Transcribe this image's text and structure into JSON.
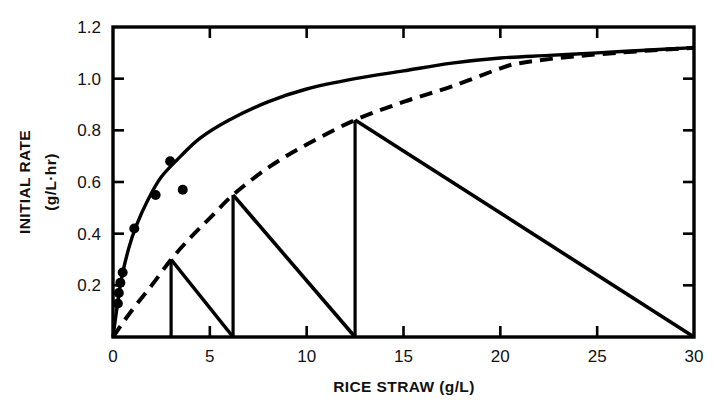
{
  "figure": {
    "background_color": "#ffffff",
    "ink_color": "#000000"
  },
  "chart_data": {
    "type": "line",
    "title": "",
    "xlabel": "RICE STRAW (g/L)",
    "ylabel": "INITIAL RATE (g/L·hr)",
    "xlim": [
      0,
      30
    ],
    "ylim": [
      0,
      1.2
    ],
    "grid": false,
    "legend": null,
    "x_ticks": [
      0,
      5,
      10,
      15,
      20,
      25,
      30
    ],
    "x_tick_labels": [
      "0",
      "5",
      "10",
      "15",
      "20",
      "25",
      "30"
    ],
    "y_ticks": [
      0,
      0.2,
      0.4,
      0.6,
      0.8,
      1.0,
      1.2
    ],
    "y_tick_labels": [
      "0",
      "0.2",
      "0.4",
      "0.6",
      "0.8",
      "1.0",
      "1.2"
    ],
    "series": [
      {
        "name": "upper-saturation-curve",
        "style": "solid",
        "x": [
          0,
          0.4,
          0.8,
          1.2,
          1.8,
          2.5,
          3.5,
          4.5,
          6,
          8,
          10,
          12.5,
          15,
          17.5,
          20,
          22.5,
          25,
          27.5,
          30
        ],
        "values": [
          0.0,
          0.21,
          0.34,
          0.43,
          0.53,
          0.62,
          0.7,
          0.77,
          0.84,
          0.91,
          0.96,
          1.0,
          1.03,
          1.06,
          1.08,
          1.09,
          1.1,
          1.11,
          1.12
        ]
      },
      {
        "name": "lower-dashed-curve",
        "style": "dashed",
        "x": [
          0,
          0.6,
          1.2,
          2,
          3,
          4,
          5,
          6.2,
          8,
          10,
          12.5,
          15,
          17.5,
          20,
          21,
          23,
          26,
          30
        ],
        "values": [
          0.0,
          0.065,
          0.125,
          0.2,
          0.3,
          0.385,
          0.46,
          0.55,
          0.655,
          0.745,
          0.84,
          0.91,
          0.97,
          1.04,
          1.06,
          1.08,
          1.1,
          1.12
        ]
      }
    ],
    "points": {
      "name": "experimental-data-points",
      "marker": "filled-circle",
      "x": [
        0.25,
        0.3,
        0.38,
        0.5,
        1.1,
        2.2,
        2.95,
        3.6
      ],
      "values": [
        0.13,
        0.17,
        0.21,
        0.25,
        0.42,
        0.55,
        0.68,
        0.57
      ]
    },
    "construction_steps": {
      "name": "stepwise-operating-construction",
      "description": "vertical risers to dashed curve with diagonal operating lines back to x-axis",
      "steps": [
        {
          "x_start": 3.0,
          "y_top": 0.3,
          "x_end": 6.2
        },
        {
          "x_start": 6.2,
          "y_top": 0.55,
          "x_end": 12.5
        },
        {
          "x_start": 12.5,
          "y_top": 0.84,
          "x_end": 30.0
        }
      ]
    },
    "annotations": []
  }
}
